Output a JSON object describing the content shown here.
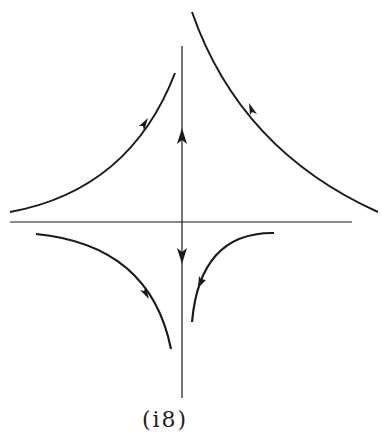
{
  "figure": {
    "type": "phase-portrait",
    "caption": "(i8)",
    "stroke_color": "#1a1a1a",
    "background": "#ffffff"
  },
  "axes": {
    "horizontal": {
      "x1": 10,
      "y1": 222,
      "x2": 352,
      "y2": 222
    },
    "vertical": {
      "x1": 182,
      "y1": 46,
      "x2": 182,
      "y2": 398
    }
  },
  "axis_arrows": [
    {
      "name": "up-arrow-upper-axis",
      "x": 182,
      "y": 137,
      "direction": "up"
    },
    {
      "name": "down-arrow-lower-axis",
      "x": 182,
      "y": 255,
      "direction": "down"
    }
  ],
  "trajectories": [
    {
      "name": "upper-left-curve",
      "path": "M 10 212 Q 130 190 175 73",
      "arrow_dir": "up-right"
    },
    {
      "name": "upper-right-curve",
      "path": "M 192 12 Q 240 150 378 212",
      "arrow_dir": "up-left"
    },
    {
      "name": "lower-left-curve",
      "path": "M 36 234 Q 150 245 171 349",
      "arrow_dir": "down-right"
    },
    {
      "name": "lower-right-curve",
      "path": "M 274 233 Q 200 232 192 322",
      "arrow_dir": "down-left"
    }
  ]
}
